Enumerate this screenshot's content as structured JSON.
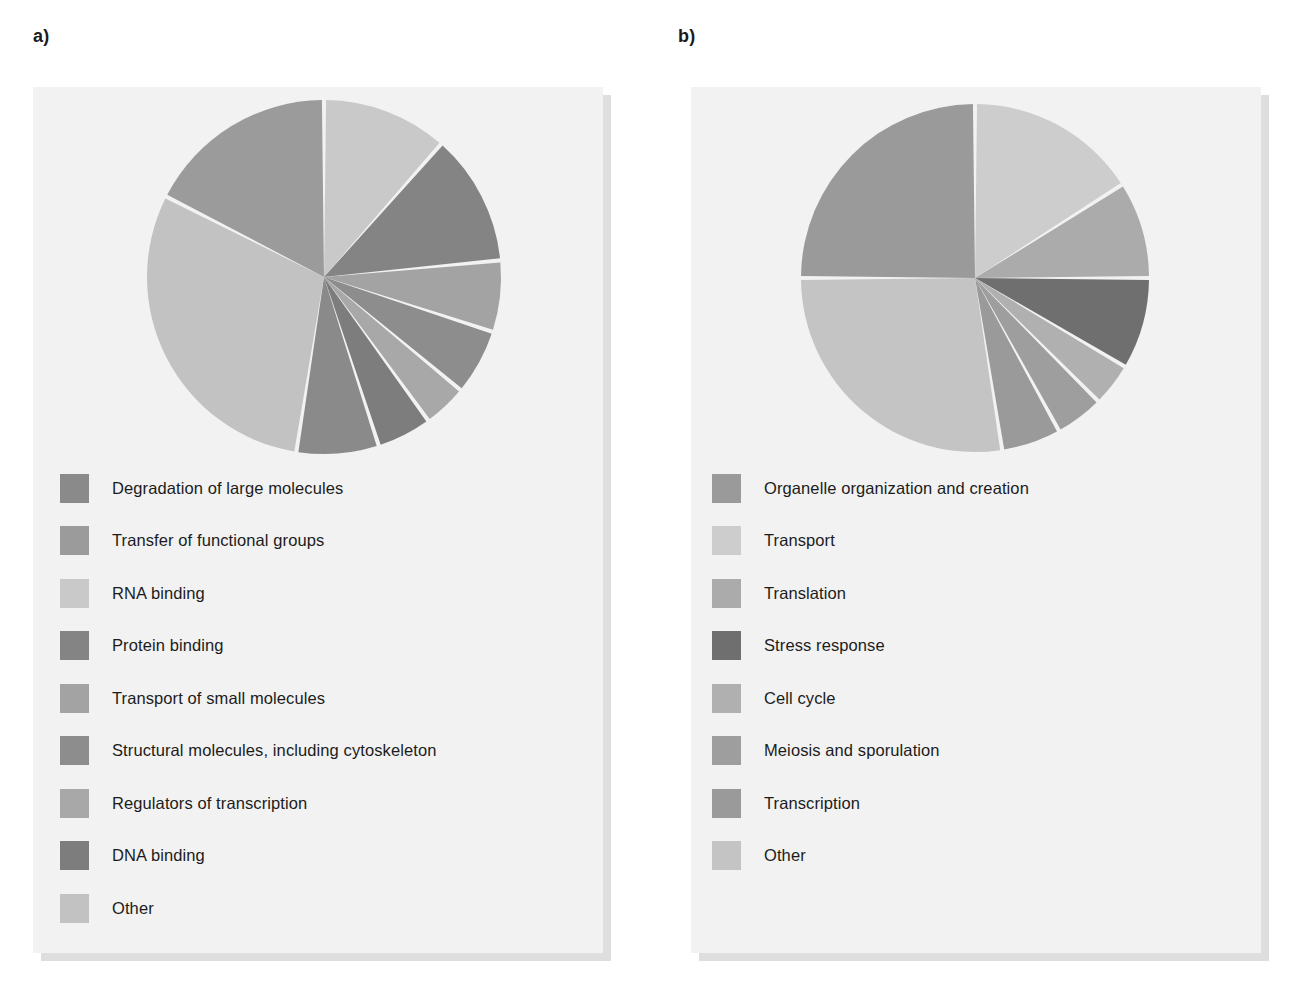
{
  "figure": {
    "panels": [
      {
        "id": "a",
        "label": "a)",
        "legend": [
          {
            "label": "Degradation of large molecules",
            "color": "#8a8a8a"
          },
          {
            "label": "Transfer of functional groups",
            "color": "#9b9b9b"
          },
          {
            "label": "RNA binding",
            "color": "#c9c9c9"
          },
          {
            "label": "Protein binding",
            "color": "#848484"
          },
          {
            "label": "Transport of small molecules",
            "color": "#a3a3a3"
          },
          {
            "label": "Structural molecules, including cytoskeleton",
            "color": "#8d8d8d"
          },
          {
            "label": "Regulators of transcription",
            "color": "#a8a8a8"
          },
          {
            "label": "DNA binding",
            "color": "#7d7d7d"
          },
          {
            "label": "Other",
            "color": "#c2c2c2"
          }
        ]
      },
      {
        "id": "b",
        "label": "b)",
        "legend": [
          {
            "label": "Organelle organization and creation",
            "color": "#9a9a9a"
          },
          {
            "label": "Transport",
            "color": "#cdcdcd"
          },
          {
            "label": "Translation",
            "color": "#ababab"
          },
          {
            "label": "Stress response",
            "color": "#6f6f6f"
          },
          {
            "label": "Cell cycle",
            "color": "#b0b0b0"
          },
          {
            "label": "Meiosis and sporulation",
            "color": "#9e9e9e"
          },
          {
            "label": "Transcription",
            "color": "#9a9a9a"
          },
          {
            "label": "Other",
            "color": "#c4c4c4"
          }
        ]
      }
    ]
  },
  "chart_data": [
    {
      "type": "pie",
      "title": "a)",
      "panel": "a",
      "start_angle_deg": 0,
      "direction": "clockwise",
      "units": "percent of genes",
      "labels": [
        "RNA binding",
        "Protein binding",
        "Transport of small molecules",
        "Structural molecules, including cytoskeleton",
        "Regulators of transcription",
        "DNA binding",
        "Degradation of large molecules",
        "Other",
        "Transfer of functional groups"
      ],
      "values": [
        11.5,
        12.0,
        6.5,
        6.0,
        4.0,
        5.0,
        7.5,
        30.0,
        17.5
      ],
      "colors": [
        "#c9c9c9",
        "#848484",
        "#a3a3a3",
        "#8d8d8d",
        "#a8a8a8",
        "#7d7d7d",
        "#8a8a8a",
        "#c2c2c2",
        "#9b9b9b"
      ],
      "legend_position": "below",
      "grid": false
    },
    {
      "type": "pie",
      "title": "b)",
      "panel": "b",
      "start_angle_deg": 0,
      "direction": "clockwise",
      "units": "percent of genes",
      "labels": [
        "Transport",
        "Translation",
        "Stress response",
        "Cell cycle",
        "Meiosis and sporulation",
        "Transcription",
        "Other",
        "Organelle organization and creation"
      ],
      "values": [
        16.0,
        9.0,
        8.5,
        4.0,
        4.5,
        5.5,
        27.5,
        25.0
      ],
      "colors": [
        "#cdcdcd",
        "#ababab",
        "#6f6f6f",
        "#b0b0b0",
        "#9e9e9e",
        "#9a9a9a",
        "#c4c4c4",
        "#9a9a9a"
      ],
      "legend_position": "below",
      "grid": false
    }
  ]
}
